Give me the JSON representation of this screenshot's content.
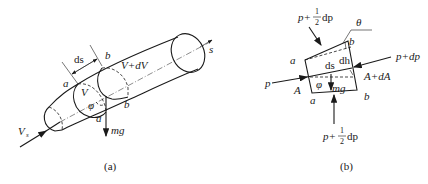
{
  "figure_a": {
    "caption": "(a)",
    "labels": {
      "inlet_velocity": "V",
      "inlet_velocity_sub": "s",
      "axis": "s",
      "ds": "ds",
      "section_a_top": "a",
      "section_a_bottom": "a",
      "section_b_top": "b",
      "section_b_bottom": "b",
      "volume_v": "V",
      "volume_v_dv": "V+dV",
      "angle": "φ",
      "weight": "mg"
    }
  },
  "figure_b": {
    "caption": "(b)",
    "labels": {
      "top_pressure_p": "p+",
      "top_pressure_num": "1",
      "top_pressure_den": "2",
      "top_pressure_dp": "dp",
      "bottom_pressure_p": "p+",
      "bottom_pressure_num": "1",
      "bottom_pressure_den": "2",
      "bottom_pressure_dp": "dp",
      "theta": "θ",
      "left_pressure": "p",
      "right_pressure": "p+dp",
      "area_a": "A",
      "area_a_da": "A+dA",
      "a_top": "a",
      "a_bottom": "a",
      "b_top": "b",
      "b_bottom": "b",
      "ds": "ds",
      "dh": "dh",
      "angle": "φ",
      "weight": "mg"
    }
  }
}
